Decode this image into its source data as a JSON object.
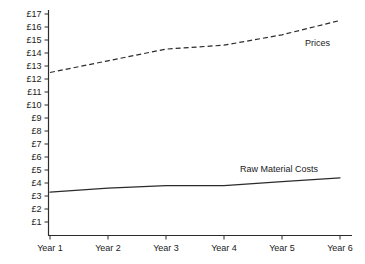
{
  "chart_data": {
    "type": "line",
    "title": "",
    "subtitle": "",
    "xlabel": "",
    "ylabel": "",
    "grid": false,
    "legend_position": "inline-annotation",
    "categories": [
      "Year 1",
      "Year 2",
      "Year 3",
      "Year 4",
      "Year 5",
      "Year 6"
    ],
    "x": [
      1,
      2,
      3,
      4,
      5,
      6
    ],
    "ylim": [
      0,
      17
    ],
    "ytick_labels": [
      "£17",
      "£16",
      "£15",
      "£14",
      "£13",
      "£12",
      "£11",
      "£10",
      "£9",
      "£8",
      "£7",
      "£6",
      "£5",
      "£4",
      "£3",
      "£2",
      "£1"
    ],
    "ytick_values": [
      17,
      16,
      15,
      14,
      13,
      12,
      11,
      10,
      9,
      8,
      7,
      6,
      5,
      4,
      3,
      2,
      1
    ],
    "series": [
      {
        "name": "Prices",
        "style": "dashed",
        "color": "#2b2b2b",
        "values": [
          12.5,
          13.4,
          14.3,
          14.6,
          15.4,
          16.5
        ]
      },
      {
        "name": "Raw Material Costs",
        "style": "solid",
        "color": "#2b2b2b",
        "values": [
          3.3,
          3.6,
          3.8,
          3.8,
          4.1,
          4.4
        ]
      }
    ],
    "annotations": [
      {
        "text": "Prices",
        "series": "Prices",
        "x_px": 305,
        "y_px": 46
      },
      {
        "text": "Raw Material Costs",
        "series": "Raw Material Costs",
        "x_px": 240,
        "y_px": 172
      }
    ]
  },
  "axes": {
    "y_axis_name": "currency-axis",
    "x_axis_name": "year-axis"
  }
}
